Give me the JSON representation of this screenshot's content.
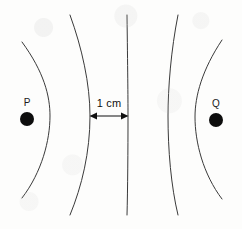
{
  "figure": {
    "kind": "wavefront-interference-diagram",
    "width": 242,
    "height": 229,
    "background_color": "#fdfdfc",
    "stroke_color": "#3a3a3a",
    "ink_color": "#101010"
  },
  "sources": [
    {
      "id": "P",
      "label": "P",
      "label_x": 27,
      "label_y": 103,
      "dot_cx": 27,
      "dot_cy": 119,
      "dot_r": 7,
      "dot_color": "#0d0d0d"
    },
    {
      "id": "Q",
      "label": "Q",
      "label_x": 216,
      "label_y": 104,
      "dot_cx": 216,
      "dot_cy": 120,
      "dot_r": 7,
      "dot_color": "#0d0d0d"
    }
  ],
  "wavefronts": [
    {
      "name": "wavefront-1-left-outer",
      "path": "M 22 42 C 44 72, 50 96, 50 116 C 50 140, 42 172, 22 198",
      "bows": "right"
    },
    {
      "name": "wavefront-2-left-inner",
      "path": "M 70 15 C 82 48, 90 84, 90 116 C 90 152, 82 186, 70 215",
      "bows": "right"
    },
    {
      "name": "wavefront-3-center",
      "path": "M 127 15 C 127.7 70, 128 95, 128 116 C 128 150, 127.7 190, 127 215",
      "bows": "none"
    },
    {
      "name": "wavefront-4-right-inner",
      "path": "M 178 15 C 171 50, 168 88, 168 116 C 168 150, 171 186, 178 215",
      "bows": "left"
    },
    {
      "name": "wavefront-5-right-outer",
      "path": "M 222 40 C 202 70, 195 96, 195 117 C 195 142, 203 174, 222 199",
      "bows": "left"
    }
  ],
  "dimension": {
    "name": "spacing-1cm",
    "text": "1 cm",
    "text_x": 109,
    "text_y": 103,
    "arrow_y": 116,
    "arrow_x1": 90,
    "arrow_x2": 128,
    "arrow_color": "#101010"
  }
}
